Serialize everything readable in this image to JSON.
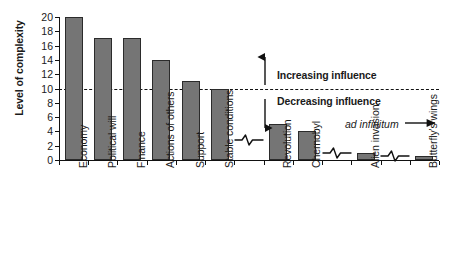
{
  "chart_data": {
    "type": "bar",
    "title": "",
    "xlabel": "",
    "ylabel": "Level of complexity",
    "ylim": [
      0,
      20
    ],
    "ytick_step": 2,
    "yticks": [
      "20",
      "18",
      "16",
      "14",
      "12",
      "10",
      "8",
      "6",
      "4",
      "2",
      "0"
    ],
    "grid": false,
    "legend": "none",
    "categories": [
      "Economy",
      "Political will",
      "Finance",
      "Actions of others",
      "Support",
      "Stable conditions",
      "",
      "Revolution",
      "Chernobyl",
      "",
      "Alien invasion",
      "",
      "Butterfly's wings"
    ],
    "values": [
      20,
      17,
      17,
      14,
      11,
      10,
      null,
      5,
      4,
      null,
      1,
      null,
      0.5
    ],
    "slot_kinds": [
      "bar",
      "bar",
      "bar",
      "bar",
      "bar",
      "bar",
      "squiggle",
      "bar",
      "bar",
      "squiggle",
      "bar",
      "squiggle",
      "bar"
    ],
    "squiggle_values": [
      2.8,
      1.0,
      0.6
    ],
    "threshold": {
      "value": 10,
      "style": "dashed",
      "above_label": "Increasing influence",
      "below_label": "Decreasing influence"
    },
    "annotations": [
      {
        "text": "ad infinitum",
        "style": "italic",
        "arrow": "right"
      }
    ],
    "colors": {
      "bar_fill": "#757575",
      "bar_stroke": "#2b2b2b",
      "axis": "#111111",
      "text": "#1a1a1a",
      "background": "#ffffff"
    }
  },
  "axis": {
    "y_title": "Level of complexity"
  },
  "annotations": {
    "increasing": "Increasing influence",
    "decreasing": "Decreasing influence",
    "ad_infinitum": "ad infinitum"
  }
}
